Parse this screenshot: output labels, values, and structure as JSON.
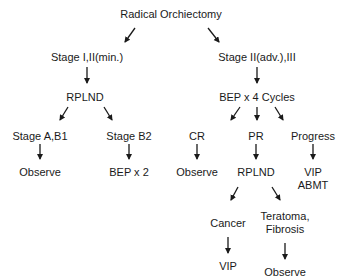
{
  "diagram": {
    "type": "flowchart",
    "nodes": {
      "root": "Radical Orchiectomy",
      "early_stage": "Stage I,II(min.)",
      "adv_stage": "Stage II(adv.),III",
      "rplnd_left": "RPLND",
      "bep4": "BEP x 4 Cycles",
      "stage_ab1": "Stage A,B1",
      "stage_b2": "Stage B2",
      "cr": "CR",
      "pr": "PR",
      "progress": "Progress",
      "observe_ab1": "Observe",
      "bep2": "BEP x 2",
      "observe_cr": "Observe",
      "rplnd_pr": "RPLND",
      "vip_abmt_1": "VIP",
      "vip_abmt_2": "ABMT",
      "cancer": "Cancer",
      "teratoma_1": "Teratoma,",
      "teratoma_2": "Fibrosis",
      "vip": "VIP",
      "observe_teratoma": "Observe"
    },
    "edges": [
      [
        "root",
        "early_stage"
      ],
      [
        "root",
        "adv_stage"
      ],
      [
        "early_stage",
        "rplnd_left"
      ],
      [
        "adv_stage",
        "bep4"
      ],
      [
        "rplnd_left",
        "stage_ab1"
      ],
      [
        "rplnd_left",
        "stage_b2"
      ],
      [
        "bep4",
        "cr"
      ],
      [
        "bep4",
        "pr"
      ],
      [
        "bep4",
        "progress"
      ],
      [
        "stage_ab1",
        "observe_ab1"
      ],
      [
        "stage_b2",
        "bep2"
      ],
      [
        "cr",
        "observe_cr"
      ],
      [
        "pr",
        "rplnd_pr"
      ],
      [
        "progress",
        "vip_abmt"
      ],
      [
        "rplnd_pr",
        "cancer"
      ],
      [
        "rplnd_pr",
        "teratoma"
      ],
      [
        "cancer",
        "vip"
      ],
      [
        "teratoma",
        "observe_teratoma"
      ]
    ]
  }
}
